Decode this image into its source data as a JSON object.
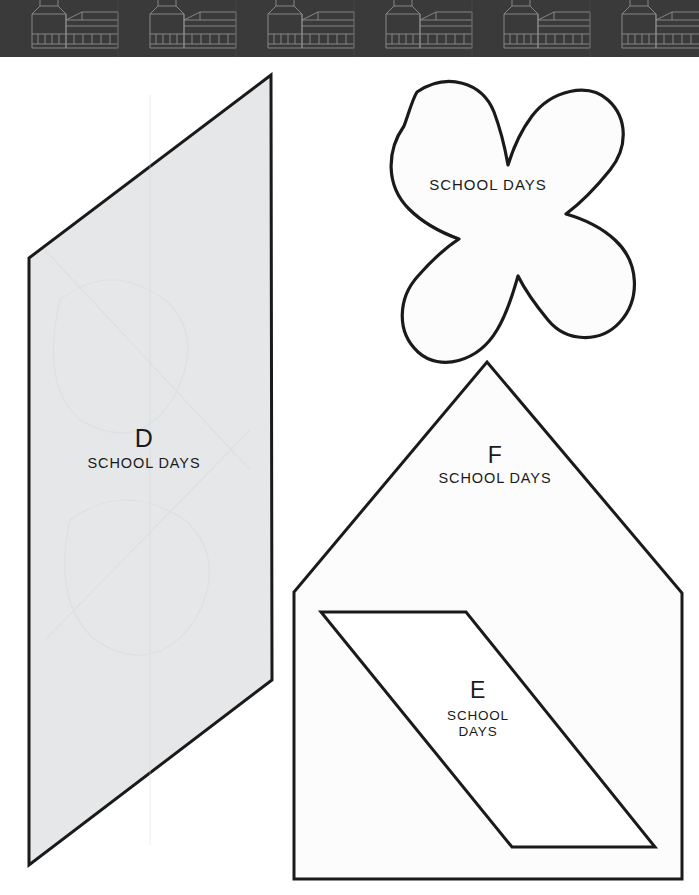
{
  "page": {
    "background_color": "#ffffff",
    "width": 699,
    "height": 895
  },
  "header": {
    "name": "schoolhouse-border-band",
    "background_color": "#3a3a3a",
    "line_color": "#8a8a8a",
    "motif": "schoolhouse",
    "repeat_count": 6,
    "height_px": 57
  },
  "shapes": [
    {
      "id": "D",
      "name": "template-d",
      "type": "parallelogram",
      "letter": "D",
      "caption": "SCHOOL DAYS",
      "fill_color": "#e6e7e8",
      "stroke_color": "#1a1a1a",
      "stroke_width": 3,
      "points": "271,75 29,258 29,865 272,680"
    },
    {
      "id": "X",
      "name": "template-x-cross",
      "type": "rounded-cross",
      "letter": "",
      "caption": "SCHOOL DAYS",
      "fill_color": "#fcfcfc",
      "stroke_color": "#1a1a1a",
      "stroke_width": 3.2
    },
    {
      "id": "F",
      "name": "template-f",
      "type": "pentagon-house",
      "letter": "F",
      "caption": "SCHOOL DAYS",
      "fill_color": "#fcfcfc",
      "stroke_color": "#1a1a1a",
      "stroke_width": 3,
      "points": "487,362 682,593 682,879 294,879 294,592"
    },
    {
      "id": "E",
      "name": "template-e",
      "type": "parallelogram",
      "letter": "E",
      "caption_line1": "SCHOOL",
      "caption_line2": "DAYS",
      "fill_color": "#ffffff",
      "stroke_color": "#1a1a1a",
      "stroke_width": 3,
      "points": "321,612 466,612 655,847 512,847"
    }
  ],
  "labels": {
    "d_letter": "D",
    "d_caption": "SCHOOL DAYS",
    "f_letter": "F",
    "f_caption": "SCHOOL DAYS",
    "e_letter": "E",
    "e_caption_line1": "SCHOOL",
    "e_caption_line2": "DAYS",
    "x_caption": "SCHOOL DAYS"
  }
}
